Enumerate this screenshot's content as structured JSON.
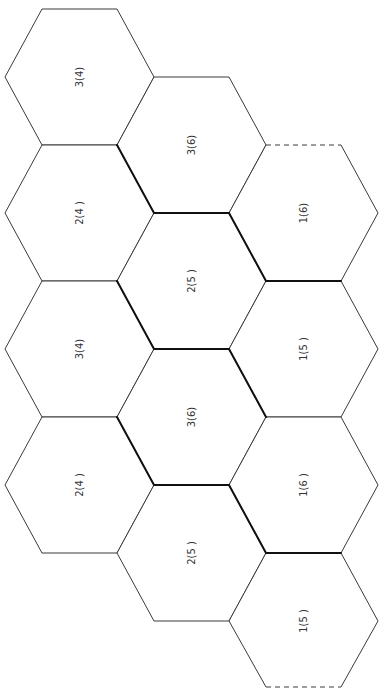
{
  "diagram": {
    "title": "",
    "hexagons": [
      {
        "id": "c1r1",
        "col": 1,
        "row": 1,
        "label": "3(4)"
      },
      {
        "id": "c1r2",
        "col": 1,
        "row": 2,
        "label": "2(4 )"
      },
      {
        "id": "c1r3",
        "col": 1,
        "row": 3,
        "label": "3(4)"
      },
      {
        "id": "c1r4",
        "col": 1,
        "row": 4,
        "label": "2(4 )"
      },
      {
        "id": "c2r1",
        "col": 2,
        "row": 1,
        "label": "3(6)"
      },
      {
        "id": "c2r2",
        "col": 2,
        "row": 2,
        "label": "2(5 )"
      },
      {
        "id": "c2r3",
        "col": 2,
        "row": 3,
        "label": "3(6)"
      },
      {
        "id": "c2r4",
        "col": 2,
        "row": 4,
        "label": "2(5 )"
      },
      {
        "id": "c3r1",
        "col": 3,
        "row": 1,
        "label": "1(6)"
      },
      {
        "id": "c3r2",
        "col": 3,
        "row": 2,
        "label": "1(5 )"
      },
      {
        "id": "c3r3",
        "col": 3,
        "row": 3,
        "label": "1(6 )"
      },
      {
        "id": "c3r4",
        "col": 3,
        "row": 4,
        "label": "1(5 )"
      }
    ],
    "dashed_edges": [
      "top of 1(6) top hexagon",
      "bottom of 1(5) bottom hexagon"
    ],
    "stroke_color": "#3a3a3a",
    "thick_color": "#111111"
  }
}
